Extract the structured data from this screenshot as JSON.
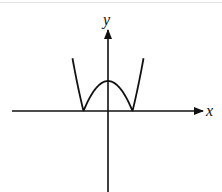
{
  "chart_data": {
    "type": "line",
    "title": "",
    "xlabel": "x",
    "ylabel": "y",
    "xlim": [
      -3,
      3.3
    ],
    "ylim": [
      -2.3,
      2.3
    ],
    "grid": false,
    "series": [
      {
        "name": "curve",
        "x": [
          -1.45,
          -1.3,
          -1.15,
          -1,
          -0.75,
          -0.5,
          -0.25,
          0,
          0.25,
          0.5,
          0.75,
          1,
          1.15,
          1.3,
          1.45
        ],
        "y": [
          1.85,
          1.2,
          0.55,
          0,
          0.45,
          0.75,
          0.93,
          1,
          0.93,
          0.75,
          0.45,
          0,
          0.55,
          1.2,
          1.85
        ]
      }
    ],
    "color": "#111111"
  }
}
